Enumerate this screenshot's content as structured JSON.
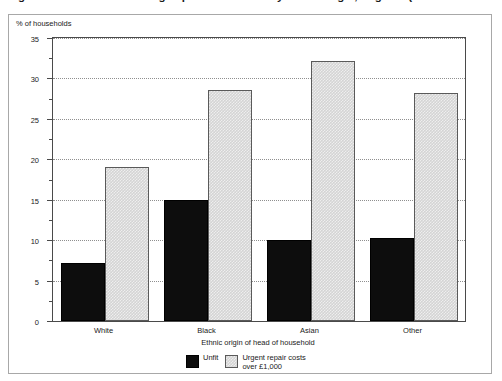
{
  "figure": {
    "title": "Figure 8.7: Households living in poor conditions by ethnic origin, England (1"
  },
  "axes": {
    "y_caption": "% of households",
    "x_title": "Ethnic origin of head of household",
    "y_ticks": [
      "0",
      "5",
      "10",
      "15",
      "20",
      "25",
      "30",
      "35"
    ]
  },
  "legend": {
    "items": [
      {
        "label": "Unfit",
        "label_line2": "",
        "color": "#0d0d0d",
        "swatch": "unfit"
      },
      {
        "label": "Urgent repair costs",
        "label_line2": "over £1,000",
        "color": "#d4d4d4",
        "swatch": "urgent"
      }
    ]
  },
  "chart_data": {
    "type": "bar",
    "title": "Figure 8.7: Households living in poor conditions by ethnic origin, England (1",
    "xlabel": "Ethnic origin of head of household",
    "ylabel": "% of households",
    "categories": [
      "White",
      "Black",
      "Asian",
      "Other"
    ],
    "series": [
      {
        "name": "Unfit",
        "color": "#0d0d0d",
        "values": [
          7.2,
          15.0,
          10.0,
          10.3
        ]
      },
      {
        "name": "Urgent repair costs over £1,000",
        "color": "#d4d4d4",
        "values": [
          19.0,
          28.6,
          32.2,
          28.2
        ]
      }
    ],
    "ylim": [
      0,
      35
    ],
    "ytick_step": 5,
    "yminor_step": 2.5,
    "grid": "horizontal-dotted",
    "legend_position": "bottom-center"
  }
}
